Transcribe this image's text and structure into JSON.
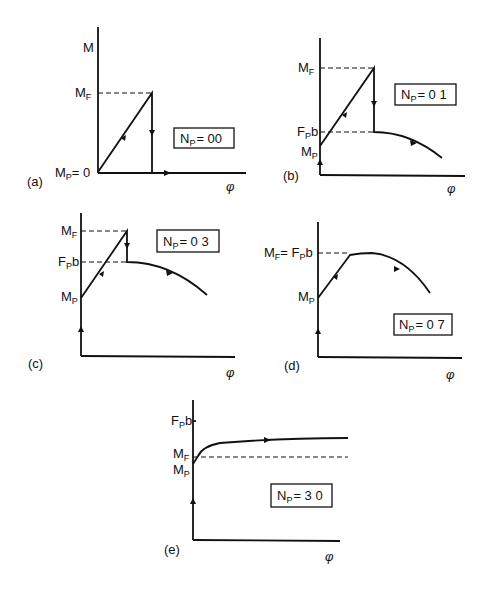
{
  "figure": {
    "x_axis_symbol": "φ",
    "y_axis_symbol": "M",
    "panels": [
      {
        "id": "a",
        "label": "(a)",
        "np_label": "N",
        "np_sub": "P",
        "np_value": "= 00",
        "y_labels": {
          "top": "M",
          "mf": "M",
          "mf_sub": "F",
          "mp": "M",
          "mp_sub": "P",
          "mp_suffix": "= 0"
        }
      },
      {
        "id": "b",
        "label": "(b)",
        "np_label": "N",
        "np_sub": "P",
        "np_value": "= 0 1",
        "y_labels": {
          "mf": "M",
          "mf_sub": "F",
          "fpb": "F",
          "fpb_sub": "P",
          "fpb_suffix": "b",
          "mp": "M",
          "mp_sub": "P"
        }
      },
      {
        "id": "c",
        "label": "(c)",
        "np_label": "N",
        "np_sub": "P",
        "np_value": "= 0 3",
        "y_labels": {
          "mf": "M",
          "mf_sub": "F",
          "fpb": "F",
          "fpb_sub": "P",
          "fpb_suffix": "b",
          "mp": "M",
          "mp_sub": "P"
        }
      },
      {
        "id": "d",
        "label": "(d)",
        "np_label": "N",
        "np_sub": "P",
        "np_value": "= 0 7",
        "y_labels": {
          "mf": "M",
          "mf_sub": "F",
          "eq": "= F",
          "fpb_sub": "P",
          "fpb_suffix": "b",
          "mp": "M",
          "mp_sub": "P"
        }
      },
      {
        "id": "e",
        "label": "(e)",
        "np_label": "N",
        "np_sub": "P",
        "np_value": "= 3 0",
        "y_labels": {
          "fpb": "F",
          "fpb_sub": "P",
          "fpb_suffix": "b",
          "mf": "M",
          "mf_sub": "F",
          "mp": "M",
          "mp_sub": "P"
        }
      }
    ]
  }
}
